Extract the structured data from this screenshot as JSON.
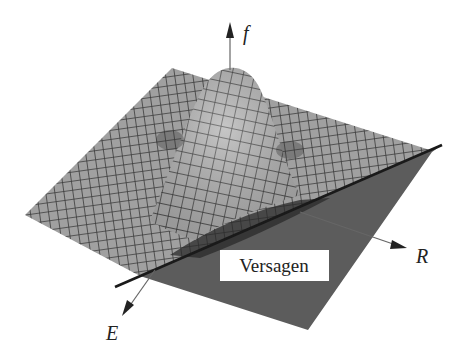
{
  "figure": {
    "axes": {
      "vertical_label": "f",
      "right_label": "R",
      "front_label": "E"
    },
    "failure_region_label": "Versagen",
    "colors": {
      "mesh_fill": "#9a9a9a",
      "mesh_line": "#3a3a3a",
      "failure_region": "#5a5a5a",
      "limit_line": "#1a1a1a",
      "axis": "#555555",
      "label_box": "#ffffff"
    }
  }
}
